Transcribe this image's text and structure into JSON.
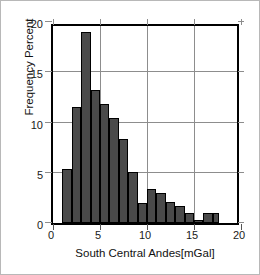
{
  "chart_data": {
    "type": "bar",
    "title": "",
    "subtitle": "",
    "xlabel": "South Central Andes[mGal]",
    "ylabel": "Frequency Percent",
    "xlim": [
      0,
      20
    ],
    "ylim": [
      0,
      20
    ],
    "xticks": [
      0,
      5,
      10,
      15,
      20
    ],
    "xtick_labels": [
      "0",
      "5",
      "10",
      "15",
      "20"
    ],
    "yticks": [
      0,
      5,
      10,
      15,
      20
    ],
    "ytick_labels": [
      "0",
      "5",
      "10",
      "15",
      "20"
    ],
    "grid": true,
    "legend": null,
    "bin_width": 1,
    "bar_color": "#4a4a4a",
    "bar_edge_color": "#000000",
    "grid_color": "#8d8d8d",
    "axis_color": "#000000",
    "bins": [
      {
        "x0": 1.0,
        "x1": 2.0,
        "value": 5.4
      },
      {
        "x0": 2.0,
        "x1": 3.0,
        "value": 11.5
      },
      {
        "x0": 3.0,
        "x1": 4.0,
        "value": 19.0
      },
      {
        "x0": 4.0,
        "x1": 5.0,
        "value": 13.2
      },
      {
        "x0": 5.0,
        "x1": 6.0,
        "value": 11.8
      },
      {
        "x0": 6.0,
        "x1": 7.0,
        "value": 10.4
      },
      {
        "x0": 7.0,
        "x1": 8.0,
        "value": 8.4
      },
      {
        "x0": 8.0,
        "x1": 9.0,
        "value": 5.1
      },
      {
        "x0": 9.0,
        "x1": 10.0,
        "value": 2.0
      },
      {
        "x0": 10.0,
        "x1": 11.0,
        "value": 3.4
      },
      {
        "x0": 11.0,
        "x1": 12.0,
        "value": 3.0
      },
      {
        "x0": 12.0,
        "x1": 13.0,
        "value": 2.1
      },
      {
        "x0": 13.0,
        "x1": 14.0,
        "value": 1.7
      },
      {
        "x0": 14.0,
        "x1": 15.0,
        "value": 1.0
      },
      {
        "x0": 15.0,
        "x1": 16.0,
        "value": 0.3
      },
      {
        "x0": 16.0,
        "x1": 17.0,
        "value": 1.0
      },
      {
        "x0": 17.0,
        "x1": 17.7,
        "value": 1.0
      }
    ],
    "categories": [
      "1-2",
      "2-3",
      "3-4",
      "4-5",
      "5-6",
      "6-7",
      "7-8",
      "8-9",
      "9-10",
      "10-11",
      "11-12",
      "12-13",
      "13-14",
      "14-15",
      "15-16",
      "16-17",
      "17-17.7"
    ],
    "values": [
      5.4,
      11.5,
      19.0,
      13.2,
      11.8,
      10.4,
      8.4,
      5.1,
      2.0,
      3.4,
      3.0,
      2.1,
      1.7,
      1.0,
      0.3,
      1.0,
      1.0
    ]
  }
}
